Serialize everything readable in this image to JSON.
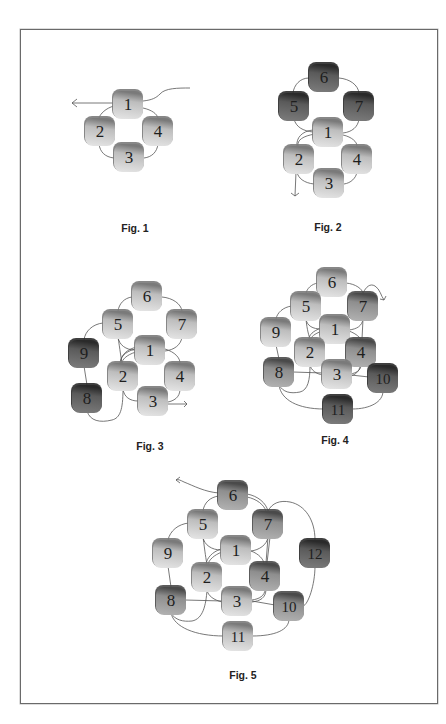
{
  "page": {
    "width": 446,
    "height": 724
  },
  "colors": {
    "light": [
      "#e6e6e6",
      "#bdbdbd",
      "#7a7a7a"
    ],
    "medium": [
      "#b3b3b3",
      "#8e8e8e",
      "#4a4a4a"
    ],
    "dark": [
      "#7d7d7d",
      "#5a5a5a",
      "#2a2a2a"
    ],
    "thread": "#555555"
  },
  "figures": [
    {
      "id": "fig1",
      "caption": "Fig. 1",
      "caption_pos": [
        135,
        222
      ],
      "beads": [
        {
          "n": "1",
          "x": 128,
          "y": 104,
          "shade": "light"
        },
        {
          "n": "2",
          "x": 100,
          "y": 131,
          "shade": "light"
        },
        {
          "n": "4",
          "x": 158,
          "y": 131,
          "shade": "light"
        },
        {
          "n": "3",
          "x": 129,
          "y": 157,
          "shade": "light"
        }
      ],
      "threads": [
        "M113,103 L72,103",
        "M72,103 l5,-4 M72,103 l5,4",
        "M143,101 C152,100 156,98 160,94 C165,88 178,88 190,88",
        "M114,106 C106,108 100,114 99,118",
        "M143,108 C152,110 157,114 158,118",
        "M99,144 C100,152 105,157 114,158",
        "M158,144 C157,152 152,157 144,158"
      ]
    },
    {
      "id": "fig2",
      "caption": "Fig. 2",
      "caption_pos": [
        328,
        221
      ],
      "beads": [
        {
          "n": "6",
          "x": 324,
          "y": 77,
          "shade": "dark"
        },
        {
          "n": "5",
          "x": 294,
          "y": 106,
          "shade": "dark"
        },
        {
          "n": "7",
          "x": 359,
          "y": 106,
          "shade": "dark"
        },
        {
          "n": "1",
          "x": 328,
          "y": 132,
          "shade": "light"
        },
        {
          "n": "2",
          "x": 299,
          "y": 159,
          "shade": "light"
        },
        {
          "n": "4",
          "x": 357,
          "y": 159,
          "shade": "light"
        },
        {
          "n": "3",
          "x": 329,
          "y": 183,
          "shade": "light"
        }
      ],
      "threads": [
        "M309,78 C300,78 294,85 293,93",
        "M339,78 C350,79 358,85 359,93",
        "M294,119 C296,127 303,131 313,132",
        "M359,119 C358,127 352,132 343,133",
        "M313,130 C302,131 296,138 297,146",
        "M315,134 C303,136 297,140 298,146",
        "M343,135 C352,137 357,142 357,146",
        "M297,172 C298,178 304,183 314,184",
        "M357,172 C356,178 351,183 344,184",
        "M296,172 L295,196",
        "M295,196 l-4,-3 M295,196 l4,-3"
      ]
    },
    {
      "id": "fig3",
      "caption": "Fig. 3",
      "caption_pos": [
        150,
        440
      ],
      "beads": [
        {
          "n": "6",
          "x": 147,
          "y": 296,
          "shade": "light"
        },
        {
          "n": "5",
          "x": 118,
          "y": 324,
          "shade": "light"
        },
        {
          "n": "7",
          "x": 182,
          "y": 324,
          "shade": "light"
        },
        {
          "n": "9",
          "x": 84,
          "y": 353,
          "shade": "dark"
        },
        {
          "n": "1",
          "x": 150,
          "y": 350,
          "shade": "light"
        },
        {
          "n": "2",
          "x": 123,
          "y": 376,
          "shade": "light"
        },
        {
          "n": "4",
          "x": 180,
          "y": 376,
          "shade": "light"
        },
        {
          "n": "8",
          "x": 87,
          "y": 398,
          "shade": "dark"
        },
        {
          "n": "3",
          "x": 153,
          "y": 401,
          "shade": "light"
        }
      ],
      "threads": [
        "M132,297 C124,298 119,304 118,311",
        "M162,297 C173,298 181,304 182,311",
        "M118,337 C119,345 126,350 135,350",
        "M182,337 C181,345 174,350 165,351",
        "M103,323 C93,324 85,331 84,340",
        "M84,366 L87,385",
        "M87,411 C90,421 100,423 112,420 C120,418 123,410 123,389",
        "M135,349 C124,352 120,358 121,363",
        "M136,352 C126,355 122,360 122,363",
        "M137,347 C127,349 121,355 120,363",
        "M118,337 C120,350 121,358 122,363",
        "M165,349 C175,352 180,358 180,363",
        "M180,389 C180,398 173,401 168,402",
        "M123,389 C124,397 130,401 138,401",
        "M168,404 L187,404",
        "M187,404 l-3,-3 M187,404 l-3,3"
      ]
    },
    {
      "id": "fig4",
      "caption": "Fig. 4",
      "caption_pos": [
        335,
        434
      ],
      "beads": [
        {
          "n": "6",
          "x": 332,
          "y": 282,
          "shade": "light"
        },
        {
          "n": "5",
          "x": 306,
          "y": 306,
          "shade": "light"
        },
        {
          "n": "7",
          "x": 363,
          "y": 306,
          "shade": "medium"
        },
        {
          "n": "9",
          "x": 276,
          "y": 332,
          "shade": "light"
        },
        {
          "n": "1",
          "x": 335,
          "y": 329,
          "shade": "light"
        },
        {
          "n": "2",
          "x": 310,
          "y": 352,
          "shade": "light"
        },
        {
          "n": "4",
          "x": 361,
          "y": 352,
          "shade": "medium"
        },
        {
          "n": "8",
          "x": 279,
          "y": 372,
          "shade": "medium"
        },
        {
          "n": "3",
          "x": 337,
          "y": 374,
          "shade": "light"
        },
        {
          "n": "10",
          "x": 383,
          "y": 378,
          "shade": "dark"
        },
        {
          "n": "11",
          "x": 338,
          "y": 409,
          "shade": "dark"
        }
      ],
      "threads": [
        "M318,283 C311,284 307,289 306,293",
        "M346,283 C356,284 362,289 363,293",
        "M363,293 C366,287 370,283 375,286 C380,289 381,296 384,300",
        "M384,300 l-4,-1 M384,300 l2,-4",
        "M292,306 C283,307 277,313 276,319",
        "M276,345 L279,359",
        "M306,319 C307,326 313,329 321,329",
        "M363,319 C362,326 357,329 349,330",
        "M306,319 C307,330 309,336 310,339",
        "M321,328 C313,331 309,335 309,339",
        "M322,331 C314,334 311,337 311,339",
        "M349,331 C357,334 360,338 361,339",
        "M363,319 L362,339",
        "M293,372 L323,373",
        "M310,365 C311,370 316,374 323,375",
        "M279,385 C283,392 290,394 300,392 C308,390 310,380 310,365",
        "M361,365 C361,371 355,373 351,374",
        "M360,365 C360,372 354,375 351,376",
        "M351,375 L369,377",
        "M279,385 C281,400 298,409 324,409",
        "M352,409 C370,409 383,402 383,391"
      ]
    },
    {
      "id": "fig5",
      "caption": "Fig. 5",
      "caption_pos": [
        243,
        669
      ],
      "beads": [
        {
          "n": "6",
          "x": 233,
          "y": 495,
          "shade": "medium"
        },
        {
          "n": "5",
          "x": 203,
          "y": 524,
          "shade": "light"
        },
        {
          "n": "7",
          "x": 268,
          "y": 524,
          "shade": "medium"
        },
        {
          "n": "9",
          "x": 168,
          "y": 553,
          "shade": "light"
        },
        {
          "n": "1",
          "x": 236,
          "y": 550,
          "shade": "light"
        },
        {
          "n": "12",
          "x": 315,
          "y": 553,
          "shade": "dark"
        },
        {
          "n": "2",
          "x": 207,
          "y": 577,
          "shade": "light"
        },
        {
          "n": "4",
          "x": 265,
          "y": 576,
          "shade": "medium"
        },
        {
          "n": "8",
          "x": 171,
          "y": 600,
          "shade": "medium"
        },
        {
          "n": "3",
          "x": 237,
          "y": 601,
          "shade": "light"
        },
        {
          "n": "10",
          "x": 289,
          "y": 606,
          "shade": "medium"
        },
        {
          "n": "11",
          "x": 238,
          "y": 636,
          "shade": "light"
        }
      ],
      "threads": [
        "M219,493 C205,492 194,486 184,482 C180,480 178,479 176,480",
        "M176,480 l4,-3 M176,480 l4,3",
        "M219,496 C210,497 204,503 203,511",
        "M247,494 C258,496 266,503 268,511",
        "M247,497 C257,499 264,505 266,511",
        "M268,511 C272,503 280,500 290,502 C305,505 315,520 315,540",
        "M315,566 C315,585 308,605 303,606",
        "M189,523 C178,524 170,531 168,540",
        "M168,566 L171,587",
        "M203,537 C204,545 212,550 221,550",
        "M268,537 C267,545 259,550 251,551",
        "M203,537 C205,552 206,560 207,564",
        "M221,549 C212,552 207,558 206,564",
        "M222,552 C214,555 209,560 208,564",
        "M251,551 C259,554 263,559 264,563",
        "M268,537 L266,563",
        "M270,537 L267,563",
        "M185,600 L223,601",
        "M207,590 C208,596 214,600 222,602",
        "M171,613 C175,620 183,622 192,621 C203,619 206,605 207,590",
        "M265,589 C265,596 259,599 252,600",
        "M266,589 C266,598 260,601 252,602",
        "M252,601 L275,605",
        "M171,613 C174,627 195,636 224,636",
        "M252,636 C275,636 289,630 289,619"
      ]
    }
  ]
}
